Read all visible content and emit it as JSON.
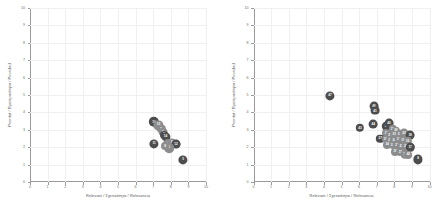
{
  "figure": {
    "background": "#ffffff",
    "bubble_color": "#4d4d4d",
    "bubble_color_light": "#8c8c8c",
    "grid_color": "#f0f0f2",
    "axis_color": "#9a9a9a"
  },
  "charts": [
    {
      "panel_name": "left-scatter-panel",
      "type": "scatter",
      "title": "",
      "xlabel": "Relevant / Σχετικότητα / Relevancia",
      "ylabel": "Prioritat / Προτεραιότητα / Prioridad",
      "xlim": [
        0,
        10
      ],
      "ylim": [
        0,
        10
      ],
      "xticks": [
        0,
        1,
        2,
        3,
        4,
        5,
        6,
        7,
        8,
        9,
        10
      ],
      "yticks": [
        0,
        1,
        2,
        3,
        4,
        5,
        6,
        7,
        8,
        9,
        10
      ],
      "grid": true,
      "legend": "none",
      "points": [
        {
          "label": "10",
          "x": 7.05,
          "y": 3.45,
          "r": 5.2,
          "shade": "dark"
        },
        {
          "label": "13",
          "x": 7.3,
          "y": 3.25,
          "r": 4.6,
          "shade": "light"
        },
        {
          "label": "9",
          "x": 7.45,
          "y": 3.05,
          "r": 4.2,
          "shade": "light"
        },
        {
          "label": "6",
          "x": 7.55,
          "y": 2.85,
          "r": 4.4,
          "shade": "light"
        },
        {
          "label": "3",
          "x": 7.62,
          "y": 2.7,
          "r": 4.0,
          "shade": "dark"
        },
        {
          "label": "14",
          "x": 7.7,
          "y": 2.6,
          "r": 4.6,
          "shade": "dark"
        },
        {
          "label": "11",
          "x": 7.05,
          "y": 2.2,
          "r": 4.6,
          "shade": "dark"
        },
        {
          "label": "4",
          "x": 7.85,
          "y": 2.2,
          "r": 5.0,
          "shade": "light"
        },
        {
          "label": "7",
          "x": 8.05,
          "y": 2.25,
          "r": 4.6,
          "shade": "light"
        },
        {
          "label": "12",
          "x": 8.3,
          "y": 2.2,
          "r": 4.4,
          "shade": "dark"
        },
        {
          "label": "1",
          "x": 7.9,
          "y": 1.95,
          "r": 4.8,
          "shade": "light"
        },
        {
          "label": "8",
          "x": 7.68,
          "y": 2.05,
          "r": 4.0,
          "shade": "light"
        },
        {
          "label": "5",
          "x": 8.7,
          "y": 1.25,
          "r": 4.6,
          "shade": "dark"
        }
      ]
    },
    {
      "panel_name": "right-scatter-panel",
      "type": "scatter",
      "title": "",
      "xlabel": "Relevant / Σχετικότητα / Relevancia",
      "ylabel": "Prioritat / Προτεραιότητα / Prioridad",
      "xlim": [
        0,
        10
      ],
      "ylim": [
        0,
        10
      ],
      "xticks": [
        0,
        1,
        2,
        3,
        4,
        5,
        6,
        7,
        8,
        9,
        10
      ],
      "yticks": [
        0,
        1,
        2,
        3,
        4,
        5,
        6,
        7,
        8,
        9,
        10
      ],
      "grid": true,
      "legend": "none",
      "points": [
        {
          "label": "47",
          "x": 4.35,
          "y": 4.95,
          "r": 4.6,
          "shade": "dark"
        },
        {
          "label": "46",
          "x": 6.85,
          "y": 4.35,
          "r": 4.4,
          "shade": "dark"
        },
        {
          "label": "41",
          "x": 6.9,
          "y": 4.1,
          "r": 4.4,
          "shade": "dark"
        },
        {
          "label": "43",
          "x": 6.05,
          "y": 3.1,
          "r": 4.2,
          "shade": "dark"
        },
        {
          "label": "44",
          "x": 6.8,
          "y": 3.35,
          "r": 4.4,
          "shade": "dark"
        },
        {
          "label": "39",
          "x": 7.55,
          "y": 3.2,
          "r": 4.2,
          "shade": "dark"
        },
        {
          "label": "40",
          "x": 7.7,
          "y": 3.4,
          "r": 4.4,
          "shade": "dark"
        },
        {
          "label": "35",
          "x": 7.9,
          "y": 3.05,
          "r": 4.2,
          "shade": "light"
        },
        {
          "label": "36",
          "x": 8.1,
          "y": 2.95,
          "r": 4.2,
          "shade": "light"
        },
        {
          "label": "30",
          "x": 7.55,
          "y": 2.8,
          "r": 4.0,
          "shade": "light"
        },
        {
          "label": "28",
          "x": 7.75,
          "y": 2.7,
          "r": 4.2,
          "shade": "light"
        },
        {
          "label": "33",
          "x": 8.0,
          "y": 2.7,
          "r": 4.0,
          "shade": "light"
        },
        {
          "label": "26",
          "x": 8.3,
          "y": 2.75,
          "r": 4.2,
          "shade": "light"
        },
        {
          "label": "22",
          "x": 8.55,
          "y": 2.8,
          "r": 4.4,
          "shade": "light"
        },
        {
          "label": "18",
          "x": 8.9,
          "y": 2.7,
          "r": 4.4,
          "shade": "dark"
        },
        {
          "label": "27",
          "x": 7.2,
          "y": 2.5,
          "r": 4.2,
          "shade": "dark"
        },
        {
          "label": "31",
          "x": 7.5,
          "y": 2.45,
          "r": 4.0,
          "shade": "light"
        },
        {
          "label": "29",
          "x": 7.75,
          "y": 2.4,
          "r": 4.0,
          "shade": "light"
        },
        {
          "label": "24",
          "x": 8.0,
          "y": 2.4,
          "r": 4.2,
          "shade": "light"
        },
        {
          "label": "21",
          "x": 8.25,
          "y": 2.45,
          "r": 4.2,
          "shade": "light"
        },
        {
          "label": "19",
          "x": 8.5,
          "y": 2.4,
          "r": 4.2,
          "shade": "light"
        },
        {
          "label": "16",
          "x": 8.75,
          "y": 2.35,
          "r": 4.2,
          "shade": "light"
        },
        {
          "label": "34",
          "x": 7.6,
          "y": 2.15,
          "r": 4.0,
          "shade": "light"
        },
        {
          "label": "32",
          "x": 7.9,
          "y": 2.1,
          "r": 4.0,
          "shade": "light"
        },
        {
          "label": "25",
          "x": 8.15,
          "y": 2.1,
          "r": 4.2,
          "shade": "light"
        },
        {
          "label": "23",
          "x": 8.4,
          "y": 2.05,
          "r": 4.2,
          "shade": "light"
        },
        {
          "label": "20",
          "x": 8.65,
          "y": 2.05,
          "r": 4.2,
          "shade": "light"
        },
        {
          "label": "17",
          "x": 8.9,
          "y": 2.0,
          "r": 4.2,
          "shade": "dark"
        },
        {
          "label": "38",
          "x": 8.05,
          "y": 1.75,
          "r": 4.0,
          "shade": "light"
        },
        {
          "label": "37",
          "x": 8.35,
          "y": 1.7,
          "r": 4.0,
          "shade": "light"
        },
        {
          "label": "15",
          "x": 8.6,
          "y": 1.6,
          "r": 4.2,
          "shade": "light"
        },
        {
          "label": "42",
          "x": 8.8,
          "y": 1.55,
          "r": 4.0,
          "shade": "light"
        },
        {
          "label": "8",
          "x": 9.35,
          "y": 1.3,
          "r": 4.6,
          "shade": "dark"
        }
      ]
    }
  ]
}
